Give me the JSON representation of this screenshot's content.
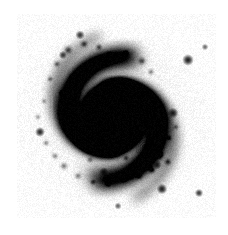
{
  "figure": {
    "domain": "natural-image",
    "kind": "astronomical-image",
    "colormap": "inverted-grayscale",
    "background_label": "",
    "title": "",
    "caption": "",
    "axis_labels": [],
    "tick_labels": [],
    "annotations": []
  },
  "canvas": {
    "width": 228,
    "height": 235,
    "page_background": "#ffffff",
    "field_background": "#f7f7f7",
    "ink_color": "#000000"
  },
  "field": {
    "x": 17,
    "y": 14,
    "width": 199,
    "height": 204,
    "noise_amplitude": 0.055,
    "noise_cell": 1
  },
  "galaxy": {
    "center_x": 113,
    "center_y": 118,
    "disk_radius": 86,
    "disk_peak_opacity": 0.2,
    "disk_falloff": 1.45,
    "bulge_radius": 17,
    "bulge_opacity": 0.72,
    "nucleus_radius": 5.5,
    "nucleus_opacity": 0.86,
    "inner_ring_radius": 26,
    "inner_ring_opacity": 0.28,
    "position_angle_deg": 22,
    "axis_ratio": 0.93
  },
  "spiral_arms": [
    {
      "name": "arm-a",
      "start_angle_deg": 10,
      "turns": 1.22,
      "pitch": 0.235,
      "r0": 11,
      "width": 9.5,
      "opacity": 0.4
    },
    {
      "name": "arm-b",
      "start_angle_deg": 190,
      "turns": 1.22,
      "pitch": 0.235,
      "r0": 11,
      "width": 9.5,
      "opacity": 0.4
    },
    {
      "name": "arm-c",
      "start_angle_deg": 100,
      "turns": 0.95,
      "pitch": 0.255,
      "r0": 16,
      "width": 7.5,
      "opacity": 0.27
    },
    {
      "name": "arm-d",
      "start_angle_deg": 285,
      "turns": 0.95,
      "pitch": 0.255,
      "r0": 16,
      "width": 7.5,
      "opacity": 0.27
    },
    {
      "name": "arm-e",
      "start_angle_deg": 60,
      "turns": 0.7,
      "pitch": 0.3,
      "r0": 34,
      "width": 6.0,
      "opacity": 0.2
    },
    {
      "name": "arm-f",
      "start_angle_deg": 235,
      "turns": 0.7,
      "pitch": 0.3,
      "r0": 34,
      "width": 6.0,
      "opacity": 0.2
    }
  ],
  "hii_knots": [
    {
      "x": 68,
      "y": 50,
      "r": 2.4,
      "o": 0.55
    },
    {
      "x": 84,
      "y": 44,
      "r": 2.0,
      "o": 0.5
    },
    {
      "x": 99,
      "y": 47,
      "r": 1.8,
      "o": 0.45
    },
    {
      "x": 110,
      "y": 55,
      "r": 1.7,
      "o": 0.42
    },
    {
      "x": 126,
      "y": 53,
      "r": 1.6,
      "o": 0.4
    },
    {
      "x": 142,
      "y": 61,
      "r": 2.2,
      "o": 0.5
    },
    {
      "x": 151,
      "y": 72,
      "r": 1.7,
      "o": 0.42
    },
    {
      "x": 57,
      "y": 64,
      "r": 1.8,
      "o": 0.45
    },
    {
      "x": 50,
      "y": 79,
      "r": 1.6,
      "o": 0.4
    },
    {
      "x": 62,
      "y": 93,
      "r": 1.7,
      "o": 0.38
    },
    {
      "x": 73,
      "y": 78,
      "r": 2.0,
      "o": 0.46
    },
    {
      "x": 90,
      "y": 69,
      "r": 1.6,
      "o": 0.4
    },
    {
      "x": 102,
      "y": 90,
      "r": 2.1,
      "o": 0.52
    },
    {
      "x": 109,
      "y": 100,
      "r": 1.8,
      "o": 0.48
    },
    {
      "x": 120,
      "y": 86,
      "r": 1.5,
      "o": 0.38
    },
    {
      "x": 134,
      "y": 96,
      "r": 1.6,
      "o": 0.38
    },
    {
      "x": 146,
      "y": 104,
      "r": 1.5,
      "o": 0.36
    },
    {
      "x": 158,
      "y": 122,
      "r": 2.0,
      "o": 0.44
    },
    {
      "x": 149,
      "y": 134,
      "r": 1.7,
      "o": 0.4
    },
    {
      "x": 160,
      "y": 155,
      "r": 2.2,
      "o": 0.5
    },
    {
      "x": 168,
      "y": 162,
      "r": 1.9,
      "o": 0.45
    },
    {
      "x": 152,
      "y": 170,
      "r": 2.0,
      "o": 0.48
    },
    {
      "x": 139,
      "y": 176,
      "r": 1.8,
      "o": 0.44
    },
    {
      "x": 124,
      "y": 179,
      "r": 1.8,
      "o": 0.42
    },
    {
      "x": 108,
      "y": 184,
      "r": 1.7,
      "o": 0.4
    },
    {
      "x": 93,
      "y": 182,
      "r": 1.6,
      "o": 0.38
    },
    {
      "x": 78,
      "y": 176,
      "r": 1.9,
      "o": 0.42
    },
    {
      "x": 64,
      "y": 166,
      "r": 2.1,
      "o": 0.46
    },
    {
      "x": 55,
      "y": 156,
      "r": 1.8,
      "o": 0.42
    },
    {
      "x": 46,
      "y": 143,
      "r": 1.7,
      "o": 0.4
    },
    {
      "x": 90,
      "y": 160,
      "r": 1.7,
      "o": 0.38
    },
    {
      "x": 104,
      "y": 152,
      "r": 1.5,
      "o": 0.34
    },
    {
      "x": 126,
      "y": 158,
      "r": 1.6,
      "o": 0.36
    },
    {
      "x": 134,
      "y": 140,
      "r": 1.5,
      "o": 0.34
    },
    {
      "x": 169,
      "y": 138,
      "r": 1.6,
      "o": 0.34
    },
    {
      "x": 176,
      "y": 127,
      "r": 1.5,
      "o": 0.32
    },
    {
      "x": 38,
      "y": 117,
      "r": 1.6,
      "o": 0.32
    },
    {
      "x": 44,
      "y": 101,
      "r": 1.5,
      "o": 0.3
    }
  ],
  "field_stars": [
    {
      "name": "star-1",
      "x": 188,
      "y": 60,
      "r": 2.8,
      "o": 0.92
    },
    {
      "name": "star-2",
      "x": 173,
      "y": 113,
      "r": 2.6,
      "o": 0.9
    },
    {
      "name": "star-3",
      "x": 162,
      "y": 189,
      "r": 2.6,
      "o": 0.9
    },
    {
      "name": "star-4",
      "x": 199,
      "y": 193,
      "r": 2.0,
      "o": 0.8
    },
    {
      "name": "star-5",
      "x": 40,
      "y": 132,
      "r": 2.4,
      "o": 0.88
    },
    {
      "name": "star-6",
      "x": 80,
      "y": 35,
      "r": 2.2,
      "o": 0.82
    },
    {
      "name": "star-7",
      "x": 63,
      "y": 55,
      "r": 2.0,
      "o": 0.78
    },
    {
      "name": "star-8",
      "x": 104,
      "y": 172,
      "r": 2.3,
      "o": 0.85
    },
    {
      "name": "star-9",
      "x": 205,
      "y": 47,
      "r": 1.6,
      "o": 0.6
    },
    {
      "name": "star-10",
      "x": 118,
      "y": 206,
      "r": 1.7,
      "o": 0.62
    },
    {
      "name": "star-11",
      "x": 146,
      "y": 121,
      "r": 2.0,
      "o": 0.78
    },
    {
      "name": "star-12",
      "x": 157,
      "y": 165,
      "r": 2.2,
      "o": 0.82
    }
  ],
  "marked_source": {
    "name": "supernova-marker",
    "x": 146,
    "y": 148,
    "core_radius": 2.2,
    "rings": [
      4.0,
      6.0,
      8.0,
      10.0
    ],
    "ring_opacity": 0.55,
    "label": ""
  }
}
